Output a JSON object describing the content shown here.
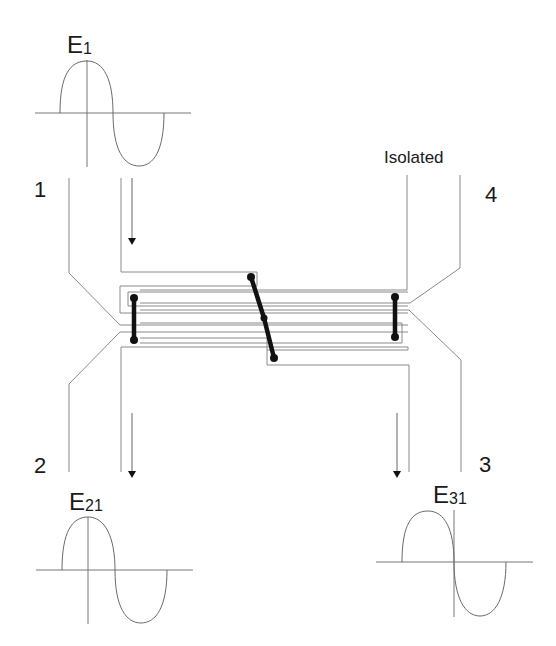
{
  "diagram": {
    "type": "directional-coupler-schematic",
    "ports": [
      {
        "id": "port-1",
        "label": "1"
      },
      {
        "id": "port-2",
        "label": "2"
      },
      {
        "id": "port-3",
        "label": "3"
      },
      {
        "id": "port-4",
        "label": "4"
      }
    ],
    "isolated_label": "Isolated",
    "signals": [
      {
        "id": "E1",
        "base": "E",
        "sub": "1",
        "phase": "in-phase"
      },
      {
        "id": "E21",
        "base": "E",
        "sub": "21",
        "phase": "in-phase"
      },
      {
        "id": "E31",
        "base": "E",
        "sub": "31",
        "phase": "90-degree-shifted"
      }
    ],
    "flow_arrows": [
      {
        "from": "port-1",
        "direction": "down"
      },
      {
        "to": "port-2",
        "direction": "down"
      },
      {
        "to": "port-3",
        "direction": "down"
      }
    ],
    "colors": {
      "trace": "#8a8a8a",
      "bridge": "#111111",
      "text": "#1a1a1a"
    }
  }
}
